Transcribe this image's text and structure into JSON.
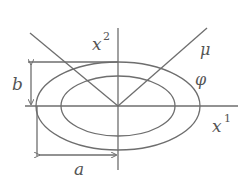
{
  "diagram": {
    "labels": {
      "x2_base": "x",
      "x2_sup": "2",
      "x1_base": "x",
      "x1_sup": "1",
      "mu": "μ",
      "phi": "φ",
      "b": "b",
      "a": "a"
    },
    "colors": {
      "stroke": "#6e6e6e",
      "text": "#555555",
      "background": "#ffffff"
    }
  }
}
